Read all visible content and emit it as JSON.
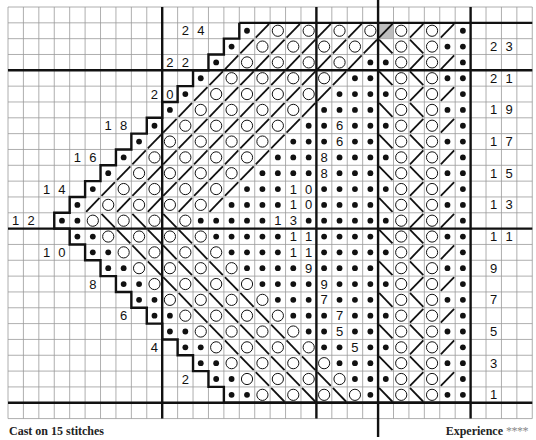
{
  "chart": {
    "grid": {
      "cols": 34,
      "rows_total": 26,
      "origin_x": 8,
      "origin_y": 7,
      "cell_w": 15.42,
      "cell_h": 15.83
    },
    "colors": {
      "grid_line": "#9a9a9a",
      "thick_line": "#111111",
      "symbol": "#111111",
      "shaded_cell": "#bdbdbd",
      "background": "#ffffff"
    },
    "legend_symbols": {
      "d": "filled-dot",
      "o": "open-circle",
      "/": "right-slanting-decrease",
      "\\": "left-slanting-decrease",
      "g": "shaded-right-slanting-decrease",
      ".": "empty"
    },
    "thick_vertical_cols": [
      10,
      20,
      24,
      30
    ],
    "extended_vertical_col": 24,
    "thick_horizontal_after_rows": [
      21,
      11,
      1
    ],
    "chart_first_col": [
      15,
      14,
      13,
      12,
      11,
      10,
      9,
      8,
      7,
      6,
      5,
      4,
      3,
      4,
      5,
      6,
      7,
      8,
      9,
      10,
      11,
      12,
      13,
      14
    ],
    "chart_last_col": 29,
    "rows": [
      {
        "row": 24,
        "cells": "...........24..d/o/o/o/ogo/o/d...."
      },
      {
        "row": 23,
        "cells": "..............d/o/o/o/o/\\o\\odd.23."
      },
      {
        "row": 22,
        "cells": "..........22.d/o/o/o/o/ddo/o/d...."
      },
      {
        "row": 21,
        "cells": "............d/o/o/o/o/dd\\o\\odd.21."
      },
      {
        "row": 20,
        "cells": ".........20d/o/o/o/o/ddddo/o/d...."
      },
      {
        "row": 19,
        "cells": "..........d/o/o/o/o/dddd\\o\\odd.19."
      },
      {
        "row": 18,
        "cells": "......18.d/o/o/o/o/dd6dddo/o/d...."
      },
      {
        "row": 17,
        "cells": "........d/o/o/o/o/ddd6dd\\o\\odd.17."
      },
      {
        "row": 16,
        "cells": "....16.d/o/o/o/o/ddd8ddddo/o/d...."
      },
      {
        "row": 15,
        "cells": "......d/o/o/o/o/dddd8ddd\\o\\odd.15."
      },
      {
        "row": 14,
        "cells": "..14.d/o/o/o/o/ddd10dddddo/o/d...."
      },
      {
        "row": 13,
        "cells": "....d/o/o/o/o/dddd10dddd\\o\\odd.13."
      },
      {
        "row": 12,
        "cells": "12.ddo\\o\\o\\oddddd13ddddddo/o/d...."
      },
      {
        "row": 11,
        "cells": "....ddo\\o\\o\\oddddd11dddd\\o\\odd.11."
      },
      {
        "row": 10,
        "cells": "..10.ddo\\o\\o\\odddd11dddddo/o/d...."
      },
      {
        "row": 9,
        "cells": "......ddo\\o\\o\\odddd9dddd\\o\\odd.9.."
      },
      {
        "row": 8,
        "cells": ".....8.ddo\\o\\o\\odddd9ddddo/o/d...."
      },
      {
        "row": 7,
        "cells": "........ddo\\o\\o\\oddd7ddd\\o\\odd.7.."
      },
      {
        "row": 6,
        "cells": ".......6.ddo\\o\\o\\oddd7dddo/o/d...."
      },
      {
        "row": 5,
        "cells": "..........ddo\\o\\o\\odd5dd\\o\\odd.5.."
      },
      {
        "row": 4,
        "cells": ".........4.ddo\\o\\o\\odd5ddo/o/d...."
      },
      {
        "row": 3,
        "cells": "............ddo\\o\\o\\oddd\\o\\odd.3.."
      },
      {
        "row": 2,
        "cells": "...........2.ddo\\o\\o\\odddo/o/d...."
      },
      {
        "row": 1,
        "cells": "..............ddo\\o\\o\\od\\o\\odd.1.."
      }
    ]
  },
  "footer": {
    "cast_on": "Cast on 15 stitches",
    "experience_label": "Experience",
    "experience_stars": "****"
  }
}
